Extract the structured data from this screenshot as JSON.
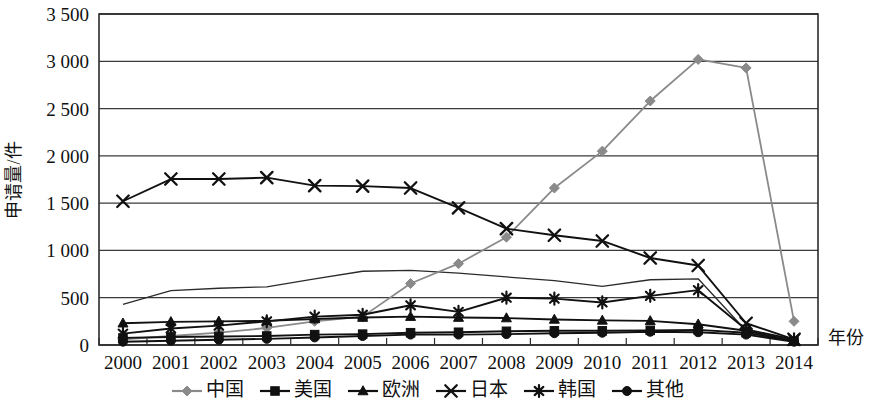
{
  "chart_data": {
    "type": "line",
    "title": "",
    "xlabel": "年份",
    "ylabel": "申请量/件",
    "x": [
      2000,
      2001,
      2002,
      2003,
      2004,
      2005,
      2006,
      2007,
      2008,
      2009,
      2010,
      2011,
      2012,
      2013,
      2014
    ],
    "xticklabels": [
      "2000",
      "2001",
      "2002",
      "2003",
      "2004",
      "2005",
      "2006",
      "2007",
      "2008",
      "2009",
      "2010",
      "2011",
      "2012",
      "2013",
      "2014"
    ],
    "yticklabels": [
      "0",
      "500",
      "1 000",
      "1 500",
      "2 000",
      "2 500",
      "3 000",
      "3 500"
    ],
    "yticks": [
      0,
      500,
      1000,
      1500,
      2000,
      2500,
      3000,
      3500
    ],
    "ylim": [
      0,
      3500
    ],
    "grid": "horizontal",
    "legend_position": "bottom",
    "series": [
      {
        "name": "中国",
        "marker": "diamond",
        "color": "#8a8a8a",
        "values": [
          60,
          95,
          130,
          180,
          250,
          300,
          650,
          860,
          1140,
          1660,
          2050,
          2580,
          3020,
          2930,
          250
        ]
      },
      {
        "name": "美国",
        "marker": "square",
        "color": "#111111",
        "values": [
          75,
          85,
          90,
          95,
          110,
          115,
          130,
          135,
          145,
          150,
          150,
          155,
          160,
          130,
          40
        ]
      },
      {
        "name": "欧洲",
        "marker": "triangle",
        "color": "#111111",
        "values": [
          230,
          245,
          250,
          255,
          275,
          290,
          300,
          290,
          285,
          270,
          260,
          255,
          220,
          150,
          45
        ]
      },
      {
        "name": "日本",
        "marker": "x",
        "color": "#111111",
        "values": [
          1520,
          1755,
          1755,
          1770,
          1685,
          1680,
          1660,
          1450,
          1230,
          1160,
          1100,
          920,
          840,
          230,
          60
        ]
      },
      {
        "name": "韩国",
        "marker": "asterisk",
        "color": "#111111",
        "values": [
          120,
          175,
          205,
          250,
          300,
          320,
          420,
          350,
          500,
          490,
          450,
          520,
          580,
          165,
          60
        ]
      },
      {
        "name": "其他",
        "marker": "circle",
        "color": "#111111",
        "values": [
          35,
          45,
          55,
          65,
          80,
          95,
          110,
          110,
          115,
          125,
          130,
          140,
          135,
          110,
          35
        ]
      }
    ],
    "unlabeled_series": {
      "name": "",
      "marker": "none",
      "color": "#2b2b2b",
      "values": [
        430,
        575,
        600,
        615,
        700,
        780,
        790,
        760,
        720,
        680,
        620,
        690,
        700,
        150,
        40
      ]
    }
  },
  "legend": {
    "items": [
      {
        "label": "中国",
        "marker": "diamond",
        "color": "#8a8a8a"
      },
      {
        "label": "美国",
        "marker": "square",
        "color": "#111111"
      },
      {
        "label": "欧洲",
        "marker": "triangle",
        "color": "#111111"
      },
      {
        "label": "日本",
        "marker": "x",
        "color": "#111111"
      },
      {
        "label": "韩国",
        "marker": "asterisk",
        "color": "#111111"
      },
      {
        "label": "其他",
        "marker": "circle",
        "color": "#111111"
      }
    ]
  }
}
